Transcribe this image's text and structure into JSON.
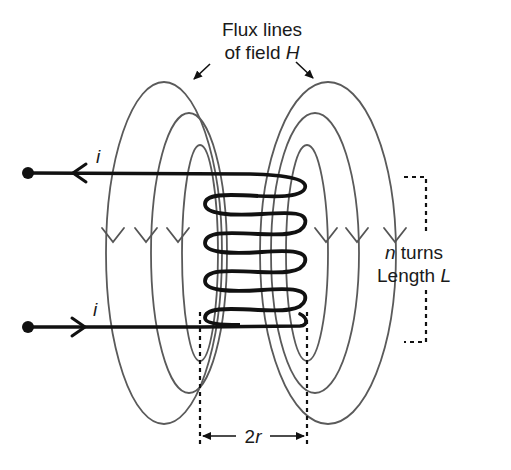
{
  "diagram": {
    "title_line1": "Flux lines",
    "title_line2_prefix": "of field ",
    "title_line2_symbol": "H",
    "current_label_top": "i",
    "current_label_bottom": "i",
    "turns_symbol": "n",
    "turns_text": " turns",
    "length_text": "Length ",
    "length_symbol": "L",
    "diameter_label_number": "2",
    "diameter_label_symbol": "r",
    "num_coil_turns": 6,
    "num_flux_loops_per_side": 3,
    "colors": {
      "wire": "#111111",
      "flux_lines": "#5a5a5a",
      "background": "#ffffff"
    }
  }
}
